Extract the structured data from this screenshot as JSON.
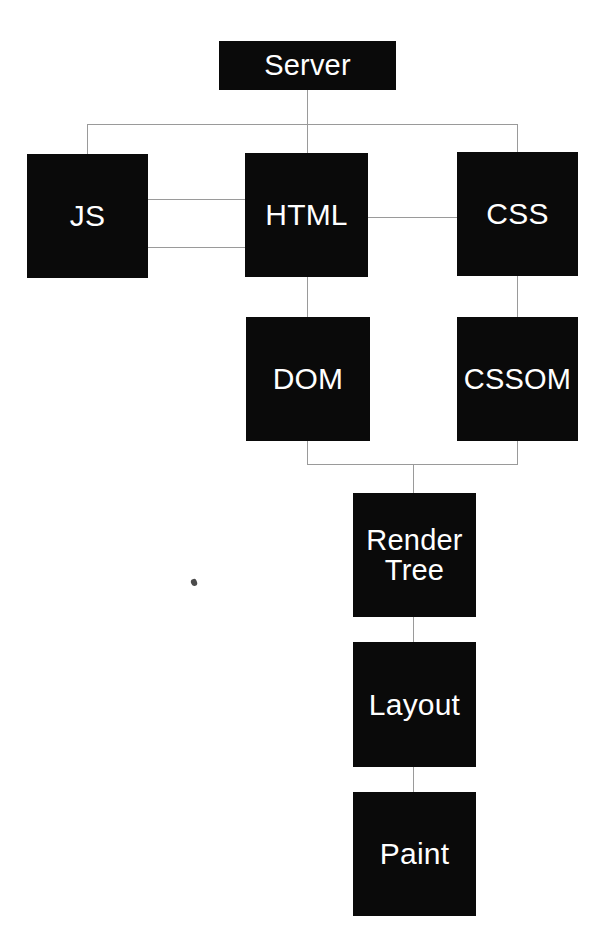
{
  "diagram": {
    "background_color": "#ffffff",
    "node_fill_color": "#0a0a0a",
    "node_text_color": "#ffffff",
    "connector_color": "#9a9a9a",
    "nodes": [
      {
        "id": "server",
        "label": "Server"
      },
      {
        "id": "js",
        "label": "JS"
      },
      {
        "id": "html",
        "label": "HTML"
      },
      {
        "id": "css",
        "label": "CSS"
      },
      {
        "id": "dom",
        "label": "DOM"
      },
      {
        "id": "cssom",
        "label": "CSSOM"
      },
      {
        "id": "render",
        "label": "Render\nTree"
      },
      {
        "id": "layout",
        "label": "Layout"
      },
      {
        "id": "paint",
        "label": "Paint"
      }
    ],
    "edges": [
      {
        "from": "server",
        "to": "js"
      },
      {
        "from": "server",
        "to": "html"
      },
      {
        "from": "server",
        "to": "css"
      },
      {
        "from": "js",
        "to": "html"
      },
      {
        "from": "html",
        "to": "js"
      },
      {
        "from": "html",
        "to": "css"
      },
      {
        "from": "html",
        "to": "dom"
      },
      {
        "from": "css",
        "to": "cssom"
      },
      {
        "from": "dom",
        "to": "render"
      },
      {
        "from": "cssom",
        "to": "render"
      },
      {
        "from": "render",
        "to": "layout"
      },
      {
        "from": "layout",
        "to": "paint"
      }
    ]
  }
}
